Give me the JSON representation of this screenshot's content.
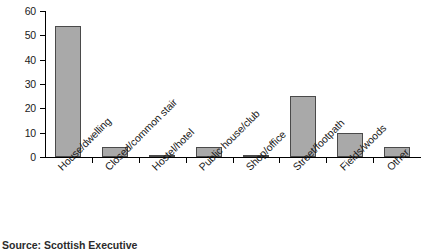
{
  "chart_data": {
    "type": "bar",
    "title": "",
    "subtitle": "",
    "xlabel": "",
    "ylabel": "",
    "ylim": [
      0,
      60
    ],
    "yticks": [
      0,
      10,
      20,
      30,
      40,
      50,
      60
    ],
    "grid": false,
    "legend": null,
    "categories": [
      "House/dwelling",
      "Closed/common stair",
      "Hostel/hotel",
      "Public house/club",
      "Shop/office",
      "Street/footpath",
      "Fields/woods",
      "Other"
    ],
    "values": [
      54,
      4,
      1,
      4,
      1,
      25,
      10,
      4
    ],
    "bar_color": "#a9a9a9",
    "bar_edge_color": "#4a4a4a",
    "axis_color": "#000000"
  },
  "caption": {
    "source": "Source: Scottish Executive"
  }
}
